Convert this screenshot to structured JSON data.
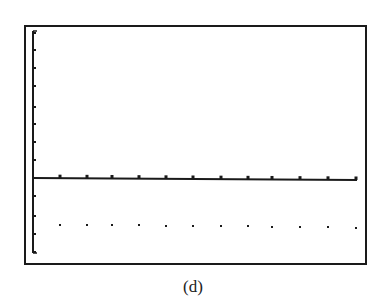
{
  "caption": "(d)",
  "colors": {
    "ink": "#1a1a1a",
    "background": "#ffffff"
  },
  "chart_data": {
    "type": "scatter",
    "title": "",
    "xlabel": "",
    "ylabel": "",
    "grid": false,
    "axes": {
      "x_axis_y_px": 178,
      "x_ticks_count": 12,
      "y_ticks_above_axis": 7,
      "y_ticks_below_axis": 3
    },
    "x": [
      1,
      2,
      3,
      4,
      5,
      6,
      7,
      8,
      9,
      10,
      11,
      12
    ],
    "y": [
      -3,
      -3,
      -3,
      -3,
      -3,
      -3,
      -3,
      -3,
      -3,
      -3,
      -3,
      -3
    ],
    "xlim": [
      0,
      12
    ],
    "ylim": [
      -4,
      8
    ]
  },
  "layout": {
    "ticks_x_px": [
      60,
      87,
      112,
      139,
      166,
      193,
      221,
      248,
      272,
      300,
      328,
      356
    ],
    "ticks_y_px": [
      33,
      50,
      68,
      86,
      107,
      124,
      142,
      160,
      196,
      216,
      234,
      252
    ],
    "dots_y_px": [
      225,
      225,
      225,
      225,
      226,
      226,
      226,
      226,
      227,
      227,
      227,
      228
    ]
  }
}
